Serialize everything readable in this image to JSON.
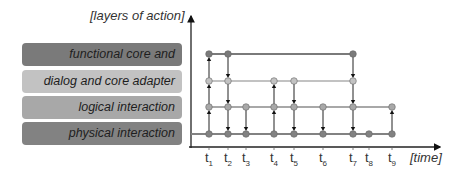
{
  "diagram": {
    "y_axis_title": "[layers of action]",
    "x_axis_title": "[time]",
    "layers": [
      {
        "id": "functional",
        "label": "functional core and planning",
        "color": "#7a7a7a",
        "line_y": 54,
        "box_top": 43,
        "line_start": 209,
        "line_end": 353
      },
      {
        "id": "dialog",
        "label": "dialog and core adapter",
        "color": "#c2c2c2",
        "line_y": 81,
        "box_top": 70,
        "line_start": 209,
        "line_end": 353
      },
      {
        "id": "logical",
        "label": "logical interaction",
        "color": "#a8a8a8",
        "line_y": 107,
        "box_top": 96,
        "line_start": 209,
        "line_end": 392
      },
      {
        "id": "physical",
        "label": "physical interaction",
        "color": "#828282",
        "line_y": 134,
        "box_top": 122,
        "line_start": 191,
        "line_end": 392
      }
    ],
    "time_points": [
      {
        "label": "t",
        "sub": "1",
        "x": 209
      },
      {
        "label": "t",
        "sub": "2",
        "x": 228
      },
      {
        "label": "t",
        "sub": "3",
        "x": 246
      },
      {
        "label": "t",
        "sub": "4",
        "x": 274
      },
      {
        "label": "t",
        "sub": "5",
        "x": 294
      },
      {
        "label": "t",
        "sub": "6",
        "x": 323
      },
      {
        "label": "t",
        "sub": "7",
        "x": 353
      },
      {
        "label": "t",
        "sub": "8",
        "x": 369
      },
      {
        "label": "t",
        "sub": "9",
        "x": 392
      }
    ],
    "events": [
      {
        "t": 1,
        "from": "physical",
        "to": "logical"
      },
      {
        "t": 1,
        "from": "logical",
        "to": "dialog"
      },
      {
        "t": 1,
        "from": "dialog",
        "to": "functional"
      },
      {
        "t": 2,
        "from": "functional",
        "to": "dialog"
      },
      {
        "t": 2,
        "from": "dialog",
        "to": "logical"
      },
      {
        "t": 2,
        "from": "logical",
        "to": "physical"
      },
      {
        "t": 3,
        "from": "logical",
        "to": "physical"
      },
      {
        "t": 4,
        "from": "physical",
        "to": "logical"
      },
      {
        "t": 4,
        "from": "logical",
        "to": "dialog"
      },
      {
        "t": 5,
        "from": "dialog",
        "to": "logical"
      },
      {
        "t": 5,
        "from": "logical",
        "to": "physical"
      },
      {
        "t": 6,
        "from": "logical",
        "to": "physical"
      },
      {
        "t": 7,
        "from": "functional",
        "to": "dialog"
      },
      {
        "t": 7,
        "from": "dialog",
        "to": "logical"
      },
      {
        "t": 7,
        "from": "logical",
        "to": "physical"
      },
      {
        "t": 9,
        "from": "physical",
        "to": "logical"
      }
    ],
    "dots": [
      {
        "t": 1,
        "layer": "functional"
      },
      {
        "t": 2,
        "layer": "functional"
      },
      {
        "t": 7,
        "layer": "functional"
      },
      {
        "t": 1,
        "layer": "dialog"
      },
      {
        "t": 2,
        "layer": "dialog"
      },
      {
        "t": 4,
        "layer": "dialog"
      },
      {
        "t": 5,
        "layer": "dialog"
      },
      {
        "t": 7,
        "layer": "dialog"
      },
      {
        "t": 1,
        "layer": "logical"
      },
      {
        "t": 2,
        "layer": "logical"
      },
      {
        "t": 3,
        "layer": "logical"
      },
      {
        "t": 4,
        "layer": "logical"
      },
      {
        "t": 5,
        "layer": "logical"
      },
      {
        "t": 6,
        "layer": "logical"
      },
      {
        "t": 7,
        "layer": "logical"
      },
      {
        "t": 9,
        "layer": "logical"
      },
      {
        "t": 1,
        "layer": "physical"
      },
      {
        "t": 2,
        "layer": "physical"
      },
      {
        "t": 3,
        "layer": "physical"
      },
      {
        "t": 4,
        "layer": "physical"
      },
      {
        "t": 5,
        "layer": "physical"
      },
      {
        "t": 6,
        "layer": "physical"
      },
      {
        "t": 7,
        "layer": "physical"
      },
      {
        "t": 8,
        "layer": "physical"
      },
      {
        "t": 9,
        "layer": "physical"
      }
    ]
  }
}
